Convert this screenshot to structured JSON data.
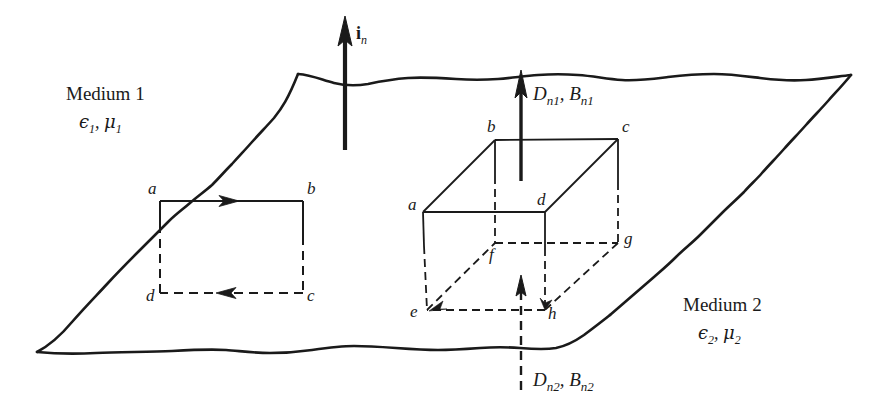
{
  "figure": {
    "background_color": "#ffffff",
    "line_color": "#1a1a1a"
  },
  "media": {
    "upper": {
      "name": "Medium 1",
      "permittivity": "ϵ",
      "permittivity_sub": "1",
      "permeability": "μ",
      "permeability_sub": "1",
      "separator": ","
    },
    "lower": {
      "name": "Medium 2",
      "permittivity": "ϵ",
      "permittivity_sub": "2",
      "permeability": "μ",
      "permeability_sub": "2",
      "separator": ","
    }
  },
  "vectors": {
    "unit_normal": {
      "symbol": "i",
      "subscript": "n"
    },
    "normal_field_upper": {
      "d_symbol": "D",
      "d_sub": "n1",
      "comma": ",",
      "b_symbol": "B",
      "b_sub": "n1"
    },
    "normal_field_lower": {
      "d_symbol": "D",
      "d_sub": "n2",
      "comma": ",",
      "b_symbol": "B",
      "b_sub": "n2"
    }
  },
  "loop": {
    "name": "rectangular-contour-abcd",
    "vertices": [
      {
        "id": "a",
        "label": "a",
        "x": 160,
        "y": 201
      },
      {
        "id": "b",
        "label": "b",
        "x": 303,
        "y": 201
      },
      {
        "id": "c",
        "label": "c",
        "x": 303,
        "y": 293
      },
      {
        "id": "d",
        "label": "d",
        "x": 160,
        "y": 293
      }
    ]
  },
  "box": {
    "name": "gaussian-pillbox-abcdefgh",
    "vertices": [
      {
        "id": "a",
        "label": "a",
        "x": 423,
        "y": 212
      },
      {
        "id": "b",
        "label": "b",
        "x": 495,
        "y": 140
      },
      {
        "id": "c",
        "label": "c",
        "x": 618,
        "y": 139
      },
      {
        "id": "d",
        "label": "d",
        "x": 545,
        "y": 212
      },
      {
        "id": "e",
        "label": "e",
        "x": 427,
        "y": 310
      },
      {
        "id": "f",
        "label": "f",
        "x": 495,
        "y": 243
      },
      {
        "id": "g",
        "label": "g",
        "x": 618,
        "y": 243
      },
      {
        "id": "h",
        "label": "h",
        "x": 545,
        "y": 310
      }
    ]
  }
}
